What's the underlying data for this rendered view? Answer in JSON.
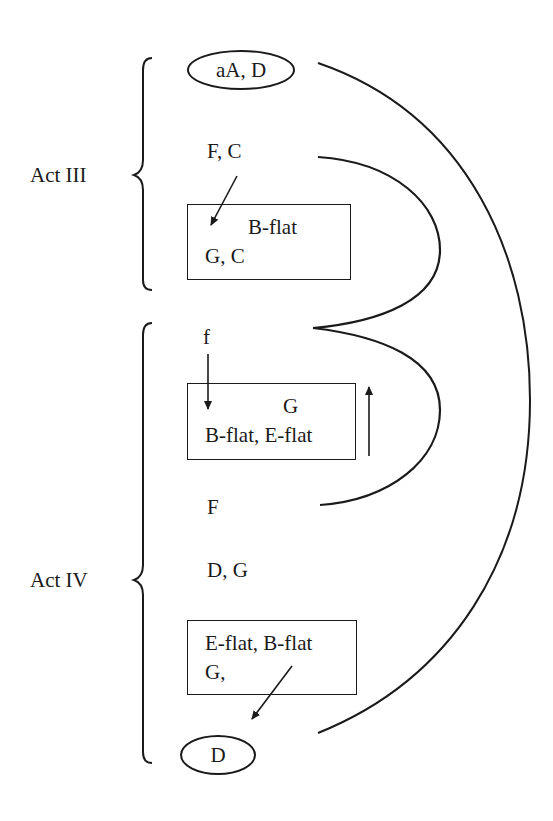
{
  "diagram": {
    "type": "tonal-structure-diagram",
    "acts": [
      {
        "id": "act3",
        "label": "Act III"
      },
      {
        "id": "act4",
        "label": "Act IV"
      }
    ],
    "nodes": {
      "start_oval": "aA, D",
      "act3_fc": "F, C",
      "act3_box_line1": "B-flat",
      "act3_box_line2": "G, C",
      "act4_f": "f",
      "act4_box1_line1": "G",
      "act4_box1_line2": "B-flat, E-flat",
      "act4_F": "F",
      "act4_dg": "D, G",
      "act4_box2_line1": "E-flat, B-flat",
      "act4_box2_line2": "G,",
      "end_oval": "D"
    },
    "connections": [
      {
        "from": "aA, D",
        "to": "D",
        "kind": "large-arc"
      },
      {
        "from": "F, C",
        "to": "f",
        "kind": "loop"
      },
      {
        "from": "f",
        "to": "F",
        "kind": "loop"
      },
      {
        "from": "F, C",
        "to": "G, C box",
        "kind": "arrow"
      },
      {
        "from": "f",
        "to": "G / B-flat, E-flat box",
        "kind": "arrow-down"
      },
      {
        "from": "box",
        "to": "upward",
        "kind": "arrow-up"
      },
      {
        "from": "E-flat, B-flat / G, box",
        "to": "D",
        "kind": "arrow"
      }
    ]
  }
}
